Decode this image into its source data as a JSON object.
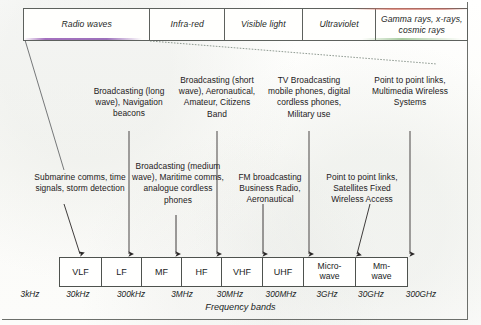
{
  "spectrum": {
    "label": "electromagnetic-spectrum-bar",
    "cells": [
      {
        "name": "radio-waves",
        "text": "Radio waves",
        "width": 127
      },
      {
        "name": "infra-red",
        "text": "Infra-red",
        "width": 75
      },
      {
        "name": "visible-light",
        "text": "Visible light",
        "width": 78
      },
      {
        "name": "ultraviolet",
        "text": "Ultraviolet",
        "width": 74
      },
      {
        "name": "gamma-rays",
        "text": "Gamma rays, x-rays, cosmic rays",
        "width": 91
      }
    ]
  },
  "upper_notes": [
    {
      "name": "note-lf-uses",
      "text": "Broadcasting (long wave), Navigation beacons",
      "left": 88,
      "top": 86,
      "width": 82
    },
    {
      "name": "note-hf-uses",
      "text": "Broadcasting (short wave), Aeronautical, Amateur, Citizens Band",
      "left": 174,
      "top": 75,
      "width": 86
    },
    {
      "name": "note-uhf-uses",
      "text": "TV Broadcasting mobile phones, digital cordless phones, Military use",
      "left": 266,
      "top": 75,
      "width": 86
    },
    {
      "name": "note-mmwave-uses",
      "text": "Point to point links, Multimedia Wireless Systems",
      "left": 372,
      "top": 75,
      "width": 76
    }
  ],
  "lower_notes": [
    {
      "name": "note-vlf-uses",
      "text": "Submarine comms, time signals, storm detection",
      "left": 33,
      "top": 172,
      "width": 94
    },
    {
      "name": "note-mf-uses",
      "text": "Broadcasting (medium wave), Maritime comms, analogue cordless phones",
      "left": 131,
      "top": 161,
      "width": 94
    },
    {
      "name": "note-vhf-uses",
      "text": "FM broadcasting Business Radio, Aeronautical",
      "left": 228,
      "top": 172,
      "width": 84
    },
    {
      "name": "note-microwave-uses",
      "text": "Point to point links, Satellites Fixed Wireless Access",
      "left": 320,
      "top": 172,
      "width": 84
    }
  ],
  "bands": {
    "label": "frequency-band-table",
    "items": [
      {
        "name": "band-vlf",
        "text": "VLF",
        "width": 42,
        "two_line": false
      },
      {
        "name": "band-lf",
        "text": "LF",
        "width": 40,
        "two_line": false
      },
      {
        "name": "band-mf",
        "text": "MF",
        "width": 40,
        "two_line": false
      },
      {
        "name": "band-hf",
        "text": "HF",
        "width": 40,
        "two_line": false
      },
      {
        "name": "band-vhf",
        "text": "VHF",
        "width": 41,
        "two_line": false
      },
      {
        "name": "band-uhf",
        "text": "UHF",
        "width": 41,
        "two_line": false
      },
      {
        "name": "band-microwave",
        "text": "Micro-wave",
        "width": 52,
        "two_line": true
      },
      {
        "name": "band-mmwave",
        "text": "Mm-wave",
        "width": 51,
        "two_line": true
      }
    ]
  },
  "frequency_ticks": [
    {
      "name": "tick-3khz",
      "text": "3kHz",
      "x": 30
    },
    {
      "name": "tick-30khz",
      "text": "30kHz",
      "x": 78
    },
    {
      "name": "tick-300khz",
      "text": "300kHz",
      "x": 131
    },
    {
      "name": "tick-3mhz",
      "text": "3MHz",
      "x": 182
    },
    {
      "name": "tick-30mhz",
      "text": "30MHz",
      "x": 230
    },
    {
      "name": "tick-300mhz",
      "text": "300MHz",
      "x": 281
    },
    {
      "name": "tick-3ghz",
      "text": "3GHz",
      "x": 327
    },
    {
      "name": "tick-30ghz",
      "text": "30GHz",
      "x": 371
    },
    {
      "name": "tick-300ghz",
      "text": "300GHz",
      "x": 421
    }
  ],
  "caption": {
    "name": "axis-caption",
    "text": "Frequency bands"
  },
  "colors": {
    "ink": "#232021",
    "rule": "#5d615d",
    "purple_wash": "#945ab2",
    "red_wash": "#d8766a",
    "green_wash": "#6ea862"
  }
}
